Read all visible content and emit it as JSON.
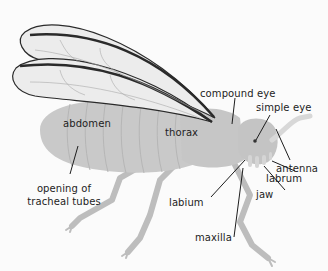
{
  "diagram": {
    "colors": {
      "background": "#fbfbfb",
      "body": "#c9c9c9",
      "body_segment_lines": "#b6b6b6",
      "wing_fill": "#ececec",
      "wing_edge": "#2a2a2a",
      "wing_veins": "#a9a9a9",
      "legs": "#bdbdbd",
      "antenna": "#d8d8d8",
      "leader_line": "#1d1d1d",
      "label_text": "#1d1d1d"
    },
    "labels": {
      "abdomen": "abdomen",
      "thorax": "thorax",
      "compound_eye": "compound eye",
      "simple_eye": "simple eye",
      "antenna": "antenna",
      "labrum": "labrum",
      "jaw": "jaw",
      "labium": "labium",
      "maxilla": "maxilla",
      "tracheal_line1": "opening of",
      "tracheal_line2": "tracheal tubes"
    }
  }
}
